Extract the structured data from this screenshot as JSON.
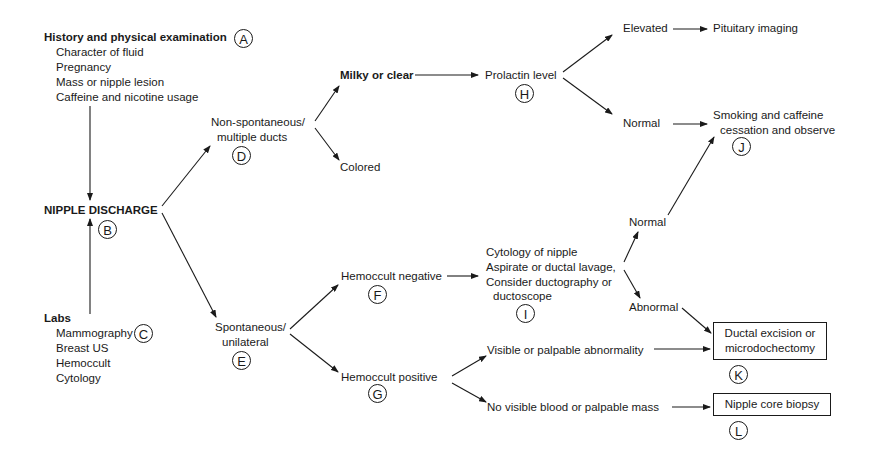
{
  "history": {
    "title": "History and physical examination",
    "label": "A",
    "items": [
      "Character of fluid",
      "Pregnancy",
      "Mass or nipple lesion",
      "Caffeine and nicotine usage"
    ]
  },
  "nipple_discharge": {
    "title": "NIPPLE DISCHARGE",
    "label": "B"
  },
  "labs": {
    "title": "Labs",
    "label": "C",
    "items": [
      "Mammography",
      "Breast US",
      "Hemoccult",
      "Cytology"
    ]
  },
  "non_spontaneous": {
    "lines": [
      "Non-spontaneous/",
      "multiple ducts"
    ],
    "label": "D"
  },
  "spontaneous": {
    "lines": [
      "Spontaneous/",
      "unilateral"
    ],
    "label": "E"
  },
  "milky": {
    "text": "Milky or clear"
  },
  "colored": {
    "text": "Colored"
  },
  "prolactin": {
    "text": "Prolactin level",
    "label": "H"
  },
  "elevated": {
    "text": "Elevated"
  },
  "pituitary": {
    "text": "Pituitary imaging"
  },
  "normal_prolactin": {
    "text": "Normal"
  },
  "smoking": {
    "lines": [
      "Smoking and caffeine",
      "cessation and observe"
    ],
    "label": "J"
  },
  "hemo_neg": {
    "text": "Hemoccult negative",
    "label": "F"
  },
  "hemo_pos": {
    "text": "Hemoccult positive",
    "label": "G"
  },
  "cytology": {
    "lines": [
      "Cytology of nipple",
      "Aspirate or ductal lavage,",
      "Consider ductography or",
      "ductoscope"
    ],
    "label": "I"
  },
  "normal_cyto": {
    "text": "Normal"
  },
  "abnormal_cyto": {
    "text": "Abnormal"
  },
  "visible": {
    "text": "Visible or palpable abnormality"
  },
  "no_visible": {
    "text": "No visible blood or palpable mass"
  },
  "ductal": {
    "lines": [
      "Ductal excision or",
      "microdochectomy"
    ],
    "label": "K"
  },
  "core_biopsy": {
    "text": "Nipple core biopsy",
    "label": "L"
  }
}
